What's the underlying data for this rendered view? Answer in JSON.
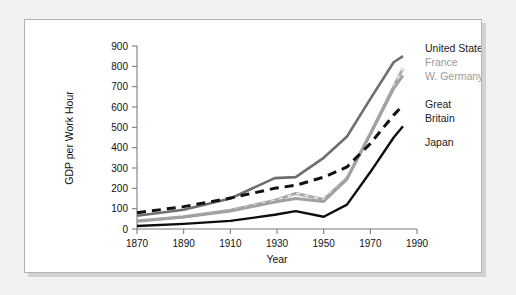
{
  "figure": {
    "background_color": "#f2f2f2",
    "card_color": "#ffffff",
    "border_color": "#b4b4b4"
  },
  "chart_data": {
    "type": "line",
    "title": "",
    "subtitle": "",
    "xlabel": "Year",
    "ylabel": "GDP per Work Hour",
    "xlim": [
      1870,
      1990
    ],
    "ylim": [
      0,
      900
    ],
    "xticks": [
      1870,
      1890,
      1910,
      1930,
      1950,
      1970,
      1990
    ],
    "yticks": [
      0,
      100,
      200,
      300,
      400,
      500,
      600,
      700,
      800,
      900
    ],
    "grid": false,
    "legend_position": "right-inline",
    "series": [
      {
        "name": "United States",
        "color": "#6e6e6e",
        "style": "solid",
        "width": 2.6,
        "x": [
          1870,
          1890,
          1910,
          1929,
          1938,
          1950,
          1960,
          1970,
          1980,
          1984
        ],
        "values": [
          65,
          95,
          150,
          250,
          255,
          350,
          455,
          640,
          820,
          850
        ]
      },
      {
        "name": "France",
        "color": "#a8a8a8",
        "style": "dashed-over-gray",
        "width": 3.0,
        "x": [
          1870,
          1890,
          1910,
          1929,
          1938,
          1950,
          1960,
          1970,
          1980,
          1984
        ],
        "values": [
          40,
          60,
          92,
          140,
          175,
          145,
          250,
          470,
          700,
          790
        ]
      },
      {
        "name": "W. Germany",
        "color": "#a0a0a0",
        "style": "solid",
        "width": 2.8,
        "x": [
          1870,
          1890,
          1910,
          1929,
          1938,
          1950,
          1960,
          1970,
          1980,
          1984
        ],
        "values": [
          38,
          58,
          88,
          132,
          150,
          135,
          245,
          465,
          690,
          755
        ]
      },
      {
        "name": "Great Britain",
        "color": "#111111",
        "style": "dashed",
        "width": 3.0,
        "x": [
          1870,
          1890,
          1910,
          1929,
          1938,
          1950,
          1960,
          1970,
          1980,
          1984
        ],
        "values": [
          80,
          110,
          152,
          200,
          215,
          255,
          305,
          420,
          560,
          610
        ]
      },
      {
        "name": "Japan",
        "color": "#0d0d0d",
        "style": "solid",
        "width": 2.4,
        "x": [
          1870,
          1890,
          1910,
          1929,
          1938,
          1950,
          1960,
          1970,
          1980,
          1984
        ],
        "values": [
          15,
          25,
          40,
          70,
          88,
          60,
          120,
          280,
          450,
          505
        ]
      }
    ],
    "legend_entries": [
      {
        "label": "United States",
        "color": "#1a1a1a"
      },
      {
        "label": "France",
        "color": "#9a9a9a"
      },
      {
        "label": "W. Germany",
        "color": "#9a9a9a"
      },
      {
        "label": "Great",
        "color": "#1a1a1a"
      },
      {
        "label": "Britain",
        "color": "#1a1a1a"
      },
      {
        "label": "Japan",
        "color": "#1a1a1a"
      }
    ]
  }
}
